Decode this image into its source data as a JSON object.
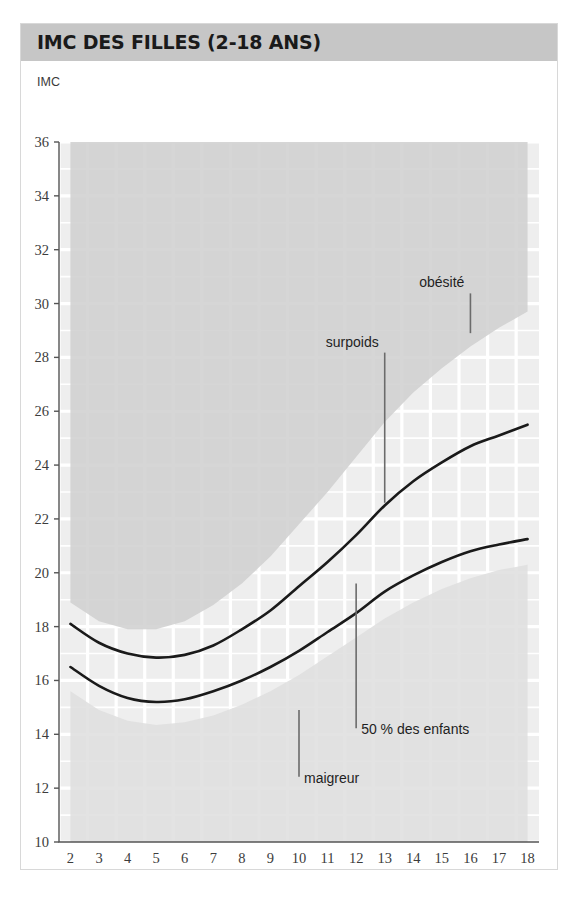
{
  "card": {
    "title": "IMC DES FILLES (2-18 ANS)",
    "header_color": "#c6c6c6",
    "border_color": "#d8d8d8"
  },
  "chart_data": {
    "type": "line",
    "title": "IMC DES FILLES (2-18 ANS)",
    "subtitle": "",
    "xlabel": "Âge (en années)",
    "ylabel": "IMC",
    "xlim": [
      1.6,
      18.4
    ],
    "ylim": [
      10,
      36
    ],
    "grid": true,
    "legend_position": "inline-annotations",
    "x_ticks": [
      2,
      3,
      4,
      5,
      6,
      7,
      8,
      9,
      10,
      11,
      12,
      13,
      14,
      15,
      16,
      17,
      18
    ],
    "y_ticks": [
      10,
      12,
      14,
      16,
      18,
      20,
      22,
      24,
      26,
      28,
      30,
      32,
      34,
      36
    ],
    "x": [
      2,
      3,
      4,
      5,
      6,
      7,
      8,
      9,
      10,
      11,
      12,
      13,
      14,
      15,
      16,
      17,
      18
    ],
    "series": [
      {
        "name": "surpoids",
        "label": "surpoids",
        "color": "#1a1a1a",
        "values": [
          18.1,
          17.4,
          17.0,
          16.85,
          16.95,
          17.3,
          17.9,
          18.6,
          19.5,
          20.4,
          21.4,
          22.5,
          23.4,
          24.1,
          24.7,
          25.1,
          25.5
        ]
      },
      {
        "name": "50 % des enfants",
        "label": "50 % des enfants",
        "color": "#1a1a1a",
        "values": [
          16.5,
          15.8,
          15.35,
          15.2,
          15.3,
          15.6,
          16.0,
          16.5,
          17.1,
          17.8,
          18.5,
          19.3,
          19.9,
          20.4,
          20.8,
          21.05,
          21.25
        ]
      }
    ],
    "bands": [
      {
        "name": "obesite",
        "label": "obésité",
        "color": "#cfcfcf",
        "description": "zone supérieure au-dessus de la courbe surpoids",
        "upper": [
          36,
          36,
          36,
          36,
          36,
          36,
          36,
          36,
          36,
          36,
          36,
          36,
          36,
          36,
          36,
          36,
          36
        ],
        "lower": [
          18.9,
          18.2,
          17.9,
          17.9,
          18.2,
          18.8,
          19.6,
          20.6,
          21.8,
          23.0,
          24.3,
          25.6,
          26.7,
          27.6,
          28.4,
          29.1,
          29.7
        ]
      },
      {
        "name": "maigreur",
        "label": "maigreur",
        "color": "#dedede",
        "description": "zone inférieure sous la courbe médiane",
        "upper": [
          15.6,
          14.9,
          14.5,
          14.35,
          14.45,
          14.7,
          15.1,
          15.6,
          16.2,
          16.9,
          17.6,
          18.3,
          18.9,
          19.4,
          19.8,
          20.1,
          20.3
        ],
        "lower": [
          10,
          10,
          10,
          10,
          10,
          10,
          10,
          10,
          10,
          10,
          10,
          10,
          10,
          10,
          10,
          10,
          10
        ]
      }
    ],
    "annotations": [
      {
        "name": "obesite",
        "text": "obésité",
        "x": 16.0,
        "y_text": 30.6,
        "leader_to_y": 28.9
      },
      {
        "name": "surpoids",
        "text": "surpoids",
        "x": 13.0,
        "y_text": 28.4,
        "leader_to_y": 22.6
      },
      {
        "name": "cinquante-pourcent",
        "text": "50 % des enfants",
        "x": 12.0,
        "y_text": 14.0,
        "leader_to_y": 19.6
      },
      {
        "name": "maigreur",
        "text": "maigreur",
        "x": 10.0,
        "y_text": 12.2,
        "leader_to_y": 14.9
      }
    ]
  }
}
